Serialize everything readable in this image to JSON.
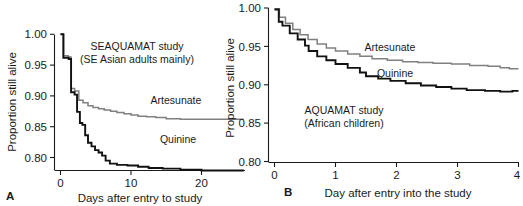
{
  "figure": {
    "panels": [
      {
        "letter": "A",
        "annotation_line1": "SEAQUAMAT study",
        "annotation_line2": "(SE Asian adults mainly)",
        "label_artesunate": "Artesunate",
        "label_quinine": "Quinine",
        "ylabel": "Proportion still alive",
        "xlabel": "Days after entry to study",
        "yticks": [
          "0.80",
          "0.85",
          "0.90",
          "0.95",
          "1.00"
        ],
        "xticks": [
          "0",
          "10",
          "20"
        ]
      },
      {
        "letter": "B",
        "annotation_line1": "AQUAMAT study",
        "annotation_line2": "(African children)",
        "label_artesunate": "Artesunate",
        "label_quinine": "Quinine",
        "ylabel": "Proportion still alive",
        "xlabel": "Day after entry into the study",
        "yticks": [
          "0.80",
          "0.85",
          "0.90",
          "0.95",
          "1.00"
        ],
        "xticks": [
          "0",
          "1",
          "2",
          "3",
          "4"
        ]
      }
    ],
    "colors": {
      "artesunate": "#808080",
      "quinine": "#111111",
      "axis": "#1a1a1a",
      "background": "#ffffff"
    }
  },
  "chart_data": [
    {
      "type": "line",
      "title": "SEAQUAMAT study (SE Asian adults mainly)",
      "subtitle": "",
      "xlabel": "Days after entry to study",
      "ylabel": "Proportion still alive",
      "xlim": [
        0,
        26
      ],
      "ylim": [
        0.78,
        1.005
      ],
      "grid": false,
      "legend": "inline-annotations",
      "xticks": [
        0,
        10,
        20
      ],
      "yticks": [
        0.8,
        0.85,
        0.9,
        0.95,
        1.0
      ],
      "series": [
        {
          "name": "Artesunate",
          "color": "#808080",
          "style": "step",
          "points": [
            [
              0,
              1.0
            ],
            [
              0.45,
              0.965
            ],
            [
              1.1,
              0.963
            ],
            [
              1.5,
              0.912
            ],
            [
              2.0,
              0.908
            ],
            [
              2.6,
              0.893
            ],
            [
              3.2,
              0.889
            ],
            [
              3.9,
              0.884
            ],
            [
              4.6,
              0.881
            ],
            [
              5.4,
              0.879
            ],
            [
              6.2,
              0.877
            ],
            [
              7.1,
              0.875
            ],
            [
              8.0,
              0.873
            ],
            [
              9.0,
              0.871
            ],
            [
              10.0,
              0.869
            ],
            [
              11.0,
              0.867
            ],
            [
              12.2,
              0.866
            ],
            [
              13.5,
              0.865
            ],
            [
              15.0,
              0.863
            ],
            [
              17.0,
              0.862
            ],
            [
              20.0,
              0.862
            ],
            [
              26.0,
              0.862
            ]
          ]
        },
        {
          "name": "Quinine",
          "color": "#111111",
          "style": "step",
          "points": [
            [
              0,
              1.0
            ],
            [
              0.4,
              0.962
            ],
            [
              1.15,
              0.96
            ],
            [
              1.5,
              0.906
            ],
            [
              2.0,
              0.902
            ],
            [
              2.35,
              0.874
            ],
            [
              2.75,
              0.856
            ],
            [
              3.1,
              0.853
            ],
            [
              3.5,
              0.836
            ],
            [
              3.9,
              0.824
            ],
            [
              4.4,
              0.818
            ],
            [
              4.9,
              0.812
            ],
            [
              5.4,
              0.808
            ],
            [
              5.9,
              0.803
            ],
            [
              6.4,
              0.795
            ],
            [
              7.0,
              0.79
            ],
            [
              8.0,
              0.788
            ],
            [
              9.5,
              0.787
            ],
            [
              11.0,
              0.785
            ],
            [
              12.5,
              0.783
            ],
            [
              14.5,
              0.782
            ],
            [
              17.0,
              0.78
            ],
            [
              20.0,
              0.779
            ],
            [
              26.0,
              0.779
            ]
          ]
        }
      ]
    },
    {
      "type": "line",
      "title": "AQUAMAT study (African children)",
      "subtitle": "",
      "xlabel": "Day after entry into the study",
      "ylabel": "Proportion still alive",
      "xlim": [
        0,
        4
      ],
      "ylim": [
        0.8,
        1.0
      ],
      "grid": false,
      "legend": "inline-annotations",
      "xticks": [
        0,
        1,
        2,
        3,
        4
      ],
      "yticks": [
        0.8,
        0.85,
        0.9,
        0.95,
        1.0
      ],
      "series": [
        {
          "name": "Artesunate",
          "color": "#808080",
          "style": "step",
          "points": [
            [
              0.0,
              0.999
            ],
            [
              0.08,
              0.988
            ],
            [
              0.18,
              0.98
            ],
            [
              0.3,
              0.972
            ],
            [
              0.42,
              0.965
            ],
            [
              0.55,
              0.959
            ],
            [
              0.7,
              0.953
            ],
            [
              0.85,
              0.948
            ],
            [
              1.0,
              0.944
            ],
            [
              1.2,
              0.94
            ],
            [
              1.4,
              0.937
            ],
            [
              1.6,
              0.934
            ],
            [
              1.85,
              0.932
            ],
            [
              2.1,
              0.93
            ],
            [
              2.35,
              0.929
            ],
            [
              2.6,
              0.928
            ],
            [
              2.9,
              0.927
            ],
            [
              3.2,
              0.925
            ],
            [
              3.5,
              0.924
            ],
            [
              3.7,
              0.922
            ],
            [
              3.85,
              0.921
            ],
            [
              4.0,
              0.921
            ]
          ]
        },
        {
          "name": "Quinine",
          "color": "#111111",
          "style": "step",
          "points": [
            [
              0.0,
              0.998
            ],
            [
              0.07,
              0.982
            ],
            [
              0.13,
              0.977
            ],
            [
              0.25,
              0.967
            ],
            [
              0.38,
              0.959
            ],
            [
              0.5,
              0.951
            ],
            [
              0.56,
              0.944
            ],
            [
              0.7,
              0.937
            ],
            [
              0.85,
              0.932
            ],
            [
              1.0,
              0.927
            ],
            [
              1.2,
              0.922
            ],
            [
              1.4,
              0.916
            ],
            [
              1.5,
              0.911
            ],
            [
              1.7,
              0.908
            ],
            [
              1.9,
              0.905
            ],
            [
              2.15,
              0.902
            ],
            [
              2.4,
              0.899
            ],
            [
              2.65,
              0.897
            ],
            [
              2.9,
              0.895
            ],
            [
              3.15,
              0.893
            ],
            [
              3.45,
              0.892
            ],
            [
              3.7,
              0.891
            ],
            [
              3.9,
              0.892
            ],
            [
              4.0,
              0.892
            ]
          ]
        }
      ]
    }
  ]
}
